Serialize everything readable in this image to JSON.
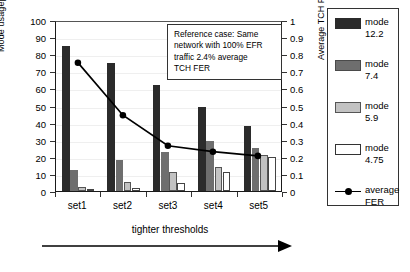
{
  "chart_data": {
    "type": "bar",
    "title": "",
    "categories": [
      "set1",
      "set2",
      "set3",
      "set4",
      "set5"
    ],
    "xlabel": "tighter thresholds",
    "ylabel": "Mode usage[%]",
    "ylabel_right": "Average TCH FER [%]",
    "ylim": [
      0,
      100
    ],
    "ylim_right": [
      0,
      1
    ],
    "yticks": [
      0,
      10,
      20,
      30,
      40,
      50,
      60,
      70,
      80,
      90,
      100
    ],
    "yticks_right": [
      0,
      0.1,
      0.2,
      0.3,
      0.4,
      0.5,
      0.6,
      0.7,
      0.8,
      0.9,
      1
    ],
    "ytick_labels": [
      "0",
      "10",
      "20",
      "30",
      "40",
      "50",
      "60",
      "70",
      "80",
      "90",
      "100"
    ],
    "ytick_labels_right": [
      "0",
      "0.1",
      "0.2",
      "0.3",
      "0.4",
      "0.5",
      "0.6",
      "0.7",
      "0.8",
      "0.9",
      "1"
    ],
    "grid": true,
    "legend_position": "right-outside",
    "series": [
      {
        "name": "mode 12.2",
        "color": "#2b2b2b",
        "axis": "left",
        "values": [
          85,
          75,
          62,
          49,
          38
        ]
      },
      {
        "name": "mode 7.4",
        "color": "#6e6e6e",
        "axis": "left",
        "values": [
          12,
          18,
          23,
          29,
          25
        ]
      },
      {
        "name": "mode 5.9",
        "color": "#c2c2c2",
        "axis": "left",
        "values": [
          2.5,
          5,
          11,
          14,
          21
        ]
      },
      {
        "name": "mode 4.75",
        "color": "#ffffff",
        "axis": "left",
        "values": [
          0.8,
          1.5,
          4.5,
          11,
          20
        ]
      },
      {
        "name": "average FER",
        "color": "#000000",
        "axis": "right",
        "type": "line",
        "values": [
          0.76,
          0.45,
          0.27,
          0.235,
          0.21
        ]
      }
    ],
    "annotation": "Reference case:  Same network with 100% EFR traffic 2.4% average TCH FER"
  },
  "axes": {
    "left": {
      "label": "Mode usage[%]"
    },
    "right": {
      "label": "Average TCH FER [%]"
    },
    "x": {
      "caption": "tighter thresholds"
    }
  },
  "note": {
    "line1": "Reference case:  Same",
    "line2": "network with 100% EFR",
    "line3": "traffic 2.4% average",
    "line4": "TCH FER"
  },
  "legend": {
    "items": [
      {
        "name": "mode",
        "value": "12.2",
        "swatch": "filled-black"
      },
      {
        "name": "mode",
        "value": "7.4",
        "swatch": "filled-darkgray"
      },
      {
        "name": "mode",
        "value": "5.9",
        "swatch": "filled-lightgray"
      },
      {
        "name": "mode",
        "value": "4.75",
        "swatch": "outlined-white"
      },
      {
        "name": "average",
        "value": "FER",
        "swatch": "line-marker"
      }
    ]
  }
}
